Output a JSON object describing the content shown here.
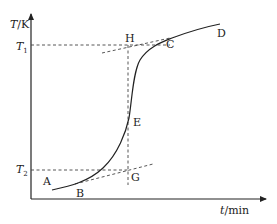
{
  "diagram": {
    "type": "heating-curve",
    "axes": {
      "y_label_var": "T",
      "y_label_unit": "/K",
      "x_label_var": "t",
      "x_label_unit": "/min"
    },
    "levels": {
      "t1_var": "T",
      "t1_sub": "1",
      "t2_var": "T",
      "t2_sub": "2"
    },
    "points": {
      "A": "A",
      "B": "B",
      "C": "C",
      "D": "D",
      "E": "E",
      "G": "G",
      "H": "H"
    },
    "colors": {
      "line": "#222222",
      "dashed": "#444444"
    }
  }
}
